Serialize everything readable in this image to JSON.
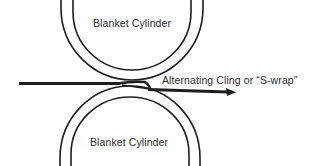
{
  "diagram": {
    "type": "printing-press nip cross-section",
    "colors": {
      "stroke": "#1e1e1e",
      "text": "#2a2a2a",
      "background": "#ffffff"
    },
    "cylinders": [
      {
        "id": "top",
        "label": "Blanket Cylinder"
      },
      {
        "id": "bottom",
        "label": "Blanket Cylinder"
      }
    ],
    "web": {
      "label": "Alternating Cling or “S-wrap”",
      "direction": "left-to-right"
    }
  }
}
